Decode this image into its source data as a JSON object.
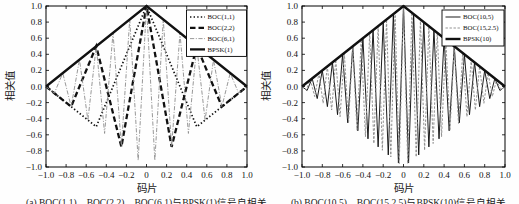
{
  "figure": {
    "background": "#fefefe",
    "caption_a": "(a) BOC(1,1)、BOC(2,2)、BOC(6,1)与BPSK(1)信号自相关",
    "caption_b": "(b) BOC(10,5)、BOC(15,2.5)与BPSK(10)信号自相关"
  },
  "colors": {
    "axis": "#000000",
    "black_line": "#111111",
    "gray_line": "#8c8c8c",
    "legend_bg": "#ffffff"
  },
  "chart_data": [
    {
      "type": "line",
      "panel": "a",
      "title": "",
      "xlabel": "码片",
      "ylabel": "相关值",
      "xlim": [
        -1,
        1
      ],
      "ylim": [
        -1,
        1
      ],
      "grid": false,
      "legend_position": "top-right",
      "x_tick_values": [
        -1,
        -0.8,
        -0.6,
        -0.4,
        -0.2,
        0,
        0.2,
        0.4,
        0.6,
        0.8,
        1
      ],
      "x_ticks": [
        "−1.0",
        "−0.8",
        "−0.6",
        "−0.4",
        "−0.2",
        "0",
        "0.2",
        "0.4",
        "0.6",
        "0.8",
        "1.0"
      ],
      "y_tick_values": [
        1,
        0.8,
        0.6,
        0.4,
        0.2,
        0,
        -0.2,
        -0.4,
        -0.6,
        -0.8,
        -1
      ],
      "y_ticks": [
        "1.0",
        "0.8",
        "0.6",
        "0.4",
        "0.2",
        "0.0",
        "−0.2",
        "−0.4",
        "−0.6",
        "−0.8",
        "−1.0"
      ],
      "series": [
        {
          "name": "BOC(1,1)",
          "line_style": "dotted",
          "color": "#111111",
          "width": 1.7,
          "points": [
            [
              -1,
              0
            ],
            [
              -0.5,
              -0.5
            ],
            [
              0,
              1
            ],
            [
              0.5,
              -0.5
            ],
            [
              1,
              0
            ]
          ]
        },
        {
          "name": "BOC(2,2)",
          "line_style": "dashed-bold",
          "color": "#111111",
          "width": 2.3,
          "points": [
            [
              -1,
              0
            ],
            [
              -0.75,
              -0.25
            ],
            [
              -0.5,
              0.5
            ],
            [
              -0.25,
              -0.75
            ],
            [
              0,
              1
            ],
            [
              0.25,
              -0.75
            ],
            [
              0.5,
              0.5
            ],
            [
              0.75,
              -0.25
            ],
            [
              1,
              0
            ]
          ]
        },
        {
          "name": "BOC(6,1)",
          "line_style": "dashdot",
          "color": "#8c8c8c",
          "width": 0.9,
          "points": [
            [
              -1,
              0
            ],
            [
              -0.917,
              -0.083
            ],
            [
              -0.833,
              0.167
            ],
            [
              -0.75,
              -0.25
            ],
            [
              -0.667,
              0.333
            ],
            [
              -0.583,
              -0.417
            ],
            [
              -0.5,
              0.5
            ],
            [
              -0.417,
              -0.583
            ],
            [
              -0.333,
              0.667
            ],
            [
              -0.25,
              -0.75
            ],
            [
              -0.167,
              0.833
            ],
            [
              -0.083,
              -0.917
            ],
            [
              0,
              1
            ],
            [
              0.083,
              -0.917
            ],
            [
              0.167,
              0.833
            ],
            [
              0.25,
              -0.75
            ],
            [
              0.333,
              0.667
            ],
            [
              0.417,
              -0.583
            ],
            [
              0.5,
              0.5
            ],
            [
              0.583,
              -0.417
            ],
            [
              0.667,
              0.333
            ],
            [
              0.75,
              -0.25
            ],
            [
              0.833,
              0.167
            ],
            [
              0.917,
              -0.083
            ],
            [
              1,
              0
            ]
          ]
        },
        {
          "name": "BPSK(1)",
          "line_style": "solid",
          "color": "#111111",
          "width": 2.3,
          "points": [
            [
              -1,
              0
            ],
            [
              0,
              1
            ],
            [
              1,
              0
            ]
          ]
        }
      ]
    },
    {
      "type": "line",
      "panel": "b",
      "title": "",
      "xlabel": "码片",
      "ylabel": "相关值",
      "xlim": [
        -1,
        1
      ],
      "ylim": [
        -1,
        1
      ],
      "grid": false,
      "legend_position": "top-right",
      "x_tick_values": [
        -1,
        -0.8,
        -0.6,
        -0.4,
        -0.2,
        0,
        0.2,
        0.4,
        0.6,
        0.8,
        1
      ],
      "x_ticks": [
        "−1.0",
        "−0.8",
        "−0.6",
        "−0.4",
        "−0.2",
        "0",
        "0.2",
        "0.4",
        "0.6",
        "0.8",
        "1.0"
      ],
      "y_tick_values": [
        1,
        0.8,
        0.6,
        0.4,
        0.2,
        0,
        -0.2,
        -0.4,
        -0.6,
        -0.8,
        -1
      ],
      "y_ticks": [
        "1.0",
        "0.8",
        "0.6",
        "0.4",
        "0.2",
        "0.0",
        "−0.2",
        "−0.4",
        "−0.6",
        "−0.8",
        "−1.0"
      ],
      "series": [
        {
          "name": "BOC(10,5)",
          "line_style": "solid",
          "color": "#111111",
          "width": 0.95,
          "points": [
            [
              -1,
              0
            ],
            [
              -0.95,
              -0.05
            ],
            [
              -0.9,
              0.1
            ],
            [
              -0.85,
              -0.15
            ],
            [
              -0.8,
              0.2
            ],
            [
              -0.75,
              -0.25
            ],
            [
              -0.7,
              0.3
            ],
            [
              -0.65,
              -0.35
            ],
            [
              -0.6,
              0.4
            ],
            [
              -0.55,
              -0.45
            ],
            [
              -0.5,
              0.5
            ],
            [
              -0.45,
              -0.55
            ],
            [
              -0.4,
              0.6
            ],
            [
              -0.35,
              -0.65
            ],
            [
              -0.3,
              0.7
            ],
            [
              -0.25,
              -0.75
            ],
            [
              -0.2,
              0.8
            ],
            [
              -0.15,
              -0.85
            ],
            [
              -0.1,
              0.9
            ],
            [
              -0.05,
              -0.95
            ],
            [
              0,
              1
            ],
            [
              0.05,
              -0.95
            ],
            [
              0.1,
              0.9
            ],
            [
              0.15,
              -0.85
            ],
            [
              0.2,
              0.8
            ],
            [
              0.25,
              -0.75
            ],
            [
              0.3,
              0.7
            ],
            [
              0.35,
              -0.65
            ],
            [
              0.4,
              0.6
            ],
            [
              0.45,
              -0.55
            ],
            [
              0.5,
              0.5
            ],
            [
              0.55,
              -0.45
            ],
            [
              0.6,
              0.4
            ],
            [
              0.65,
              -0.35
            ],
            [
              0.7,
              0.3
            ],
            [
              0.75,
              -0.25
            ],
            [
              0.8,
              0.2
            ],
            [
              0.85,
              -0.15
            ],
            [
              0.9,
              0.1
            ],
            [
              0.95,
              -0.05
            ],
            [
              1,
              0
            ]
          ]
        },
        {
          "name": "BOC(15,2.5)",
          "line_style": "dashed",
          "color": "#8c8c8c",
          "width": 0.95,
          "points": [
            [
              -1,
              0
            ],
            [
              -0.958,
              -0.042
            ],
            [
              -0.917,
              0.083
            ],
            [
              -0.875,
              -0.125
            ],
            [
              -0.833,
              0.167
            ],
            [
              -0.792,
              -0.208
            ],
            [
              -0.75,
              0.25
            ],
            [
              -0.708,
              -0.292
            ],
            [
              -0.667,
              0.333
            ],
            [
              -0.625,
              -0.375
            ],
            [
              -0.583,
              0.417
            ],
            [
              -0.542,
              -0.458
            ],
            [
              -0.5,
              0.5
            ],
            [
              -0.458,
              -0.542
            ],
            [
              -0.417,
              0.583
            ],
            [
              -0.375,
              -0.625
            ],
            [
              -0.333,
              0.667
            ],
            [
              -0.292,
              -0.708
            ],
            [
              -0.25,
              0.75
            ],
            [
              -0.208,
              -0.792
            ],
            [
              -0.167,
              0.833
            ],
            [
              -0.125,
              -0.875
            ],
            [
              -0.083,
              0.917
            ],
            [
              -0.042,
              -0.958
            ],
            [
              0,
              1
            ],
            [
              0.042,
              -0.958
            ],
            [
              0.083,
              0.917
            ],
            [
              0.125,
              -0.875
            ],
            [
              0.167,
              0.833
            ],
            [
              0.208,
              -0.792
            ],
            [
              0.25,
              0.75
            ],
            [
              0.292,
              -0.708
            ],
            [
              0.333,
              0.667
            ],
            [
              0.375,
              -0.625
            ],
            [
              0.417,
              0.583
            ],
            [
              0.458,
              -0.542
            ],
            [
              0.5,
              0.5
            ],
            [
              0.542,
              -0.458
            ],
            [
              0.583,
              0.417
            ],
            [
              0.625,
              -0.375
            ],
            [
              0.667,
              0.333
            ],
            [
              0.708,
              -0.292
            ],
            [
              0.75,
              0.25
            ],
            [
              0.792,
              -0.208
            ],
            [
              0.833,
              0.167
            ],
            [
              0.875,
              -0.125
            ],
            [
              0.917,
              0.083
            ],
            [
              0.958,
              -0.042
            ],
            [
              1,
              0
            ]
          ]
        },
        {
          "name": "BPSK(10)",
          "line_style": "solid",
          "color": "#111111",
          "width": 2.5,
          "points": [
            [
              -1,
              0
            ],
            [
              0,
              1
            ],
            [
              1,
              0
            ]
          ]
        }
      ]
    }
  ]
}
